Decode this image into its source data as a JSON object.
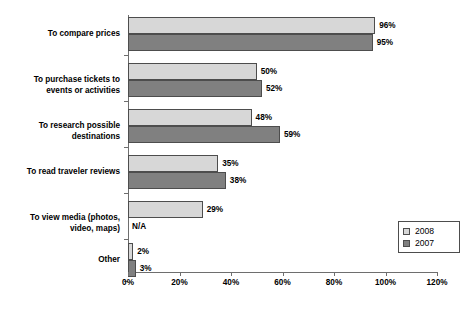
{
  "chart_data": {
    "type": "bar",
    "orientation": "horizontal",
    "title": "",
    "subtitle": "",
    "xlabel": "",
    "ylabel": "",
    "xlim": [
      0,
      120
    ],
    "xticks": [
      "0%",
      "20%",
      "40%",
      "60%",
      "80%",
      "100%",
      "120%"
    ],
    "xtick_values": [
      0,
      20,
      40,
      60,
      80,
      100,
      120
    ],
    "grid": false,
    "legend_position": "bottom-right",
    "categories": [
      "To compare prices",
      "To purchase tickets to\nevents or activities",
      "To research possible\ndestinations",
      "To read traveler reviews",
      "To view media (photos,\nvideo, maps)",
      "Other"
    ],
    "series": [
      {
        "name": "2008",
        "color": "#d7d7d7",
        "values": [
          96,
          50,
          48,
          35,
          29,
          2
        ],
        "labels": [
          "96%",
          "50%",
          "48%",
          "35%",
          "29%",
          "2%"
        ]
      },
      {
        "name": "2007",
        "color": "#808080",
        "values": [
          95,
          52,
          59,
          38,
          null,
          3
        ],
        "labels": [
          "95%",
          "52%",
          "59%",
          "38%",
          "N/A",
          "3%"
        ]
      }
    ]
  },
  "legend": {
    "entries": [
      {
        "label": "2008",
        "color": "#d7d7d7"
      },
      {
        "label": "2007",
        "color": "#808080"
      }
    ]
  }
}
